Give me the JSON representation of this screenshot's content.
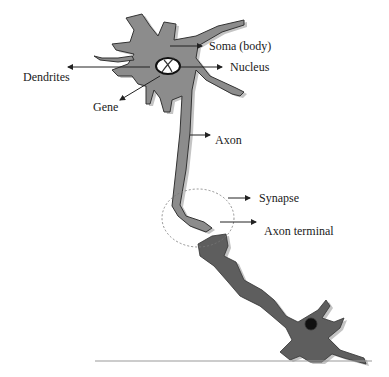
{
  "diagram": {
    "type": "neuron anatomy diagram",
    "colors": {
      "cell_fill": "#8c8c8c",
      "cell_shadow": "#c4c4c4",
      "cell_outline": "#333333",
      "dark_cell_fill": "#5e5e5e",
      "nucleus_dot": "#111111",
      "arrow": "#222222",
      "synapse_circle": "#777777",
      "baseline": "#999999"
    },
    "labels": {
      "soma": "Soma (body)",
      "nucleus": "Nucleus",
      "dendrites": "Dendrites",
      "gene": "Gene",
      "axon": "Axon",
      "synapse": "Synapse",
      "axon_terminal": "Axon terminal"
    }
  }
}
